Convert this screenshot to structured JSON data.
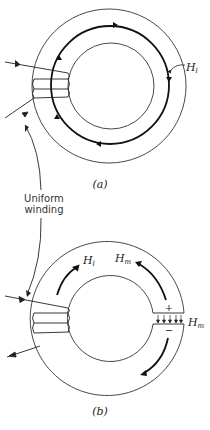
{
  "figure": {
    "panel_a": {
      "caption": "(a)",
      "field_label": "H",
      "field_subscript": "l"
    },
    "panel_b": {
      "caption": "(b)",
      "field_label_iron": "H",
      "field_subscript_iron": "l",
      "field_label_gap_top": "H",
      "field_subscript_gap_top": "m",
      "field_label_gap_right": "H",
      "field_subscript_gap_right": "m",
      "plus_sign": "+",
      "minus_sign": "−"
    },
    "shared_label": {
      "line1": "Uniform",
      "line2": "winding"
    }
  },
  "colors": {
    "stroke": "#222222",
    "background": "#ffffff"
  }
}
